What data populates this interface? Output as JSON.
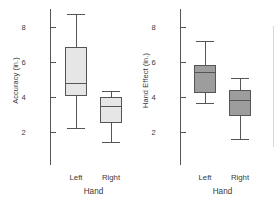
{
  "figure": {
    "background": "#ffffff",
    "line_color": "#555555",
    "text_color": "#3a3a3a"
  },
  "chart_data": [
    {
      "type": "box",
      "id": "accuracy",
      "title": "",
      "xlabel": "Hand",
      "ylabel": "Accuracy (in.)",
      "ylim": [
        1.0,
        9.0
      ],
      "yticks": [
        2,
        4,
        6,
        8
      ],
      "ytick_labels": [
        "2",
        "4",
        "6",
        "8"
      ],
      "grid": false,
      "legend": "none",
      "box_fill": "#e6e6e6",
      "categories": [
        "Left",
        "Right"
      ],
      "boxes": [
        {
          "category": "Left",
          "whisker_low": 2.2,
          "q1": 4.1,
          "median": 4.75,
          "q3": 6.85,
          "whisker_high": 8.7
        },
        {
          "category": "Right",
          "whisker_low": 1.4,
          "q1": 2.55,
          "median": 3.45,
          "q3": 3.95,
          "whisker_high": 4.3
        }
      ]
    },
    {
      "type": "box",
      "id": "hand-effect",
      "title": "",
      "xlabel": "Hand",
      "ylabel": "Hand Effect (in.)",
      "ylim": [
        1.0,
        9.0
      ],
      "yticks": [
        2,
        4,
        6,
        8
      ],
      "ytick_labels": [
        "2",
        "4",
        "6",
        "8"
      ],
      "grid": false,
      "legend": "none",
      "box_fill": "#9d9d9d",
      "categories": [
        "Left",
        "Right"
      ],
      "boxes": [
        {
          "category": "Left",
          "whisker_low": 3.65,
          "q1": 4.25,
          "median": 5.4,
          "q3": 5.8,
          "whisker_high": 7.15
        },
        {
          "category": "Right",
          "whisker_low": 1.6,
          "q1": 2.95,
          "median": 3.8,
          "q3": 4.35,
          "whisker_high": 5.05
        }
      ]
    }
  ]
}
